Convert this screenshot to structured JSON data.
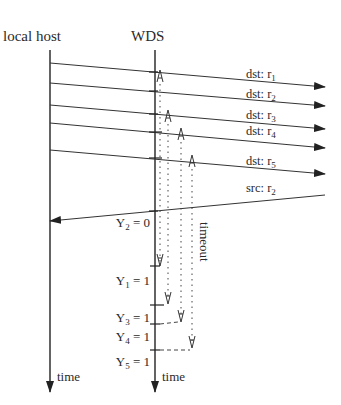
{
  "diagram": {
    "type": "sequence-timing",
    "lanes": [
      {
        "id": "local-host",
        "label": "local host",
        "x": 50
      },
      {
        "id": "wds",
        "label": "WDS",
        "x": 155
      }
    ],
    "axis_label": "time",
    "messages": [
      {
        "dir": "out",
        "prefix": "dst: r",
        "sub": "1",
        "y0": 63,
        "y1": 87
      },
      {
        "dir": "out",
        "prefix": "dst: r",
        "sub": "2",
        "y0": 83,
        "y1": 106
      },
      {
        "dir": "out",
        "prefix": "dst: r",
        "sub": "3",
        "y0": 105,
        "y1": 129
      },
      {
        "dir": "out",
        "prefix": "dst: r",
        "sub": "4",
        "y0": 123,
        "y1": 148
      },
      {
        "dir": "out",
        "prefix": "dst: r",
        "sub": "5",
        "y0": 150,
        "y1": 174
      },
      {
        "dir": "in",
        "prefix": "src: r",
        "sub": "2",
        "y0": 195,
        "y1": 221
      }
    ],
    "timeout_label": "timeout",
    "y_values": [
      {
        "name": "Y",
        "sub": "2",
        "value": "= 0"
      },
      {
        "name": "Y",
        "sub": "1",
        "value": "= 1"
      },
      {
        "name": "Y",
        "sub": "3",
        "value": "= 1"
      },
      {
        "name": "Y",
        "sub": "4",
        "value": "= 1"
      },
      {
        "name": "Y",
        "sub": "5",
        "value": "= 1"
      }
    ]
  }
}
